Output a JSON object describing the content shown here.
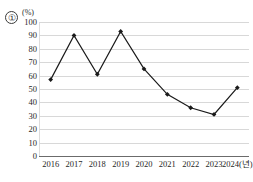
{
  "figure": {
    "item_number": "①",
    "unit_label": "(%)"
  },
  "chart_data": {
    "type": "line",
    "title": "",
    "xlabel": "",
    "ylabel": "(%)",
    "categories": [
      "2016",
      "2017",
      "2018",
      "2019",
      "2020",
      "2021",
      "2022",
      "2023",
      "2024"
    ],
    "x_tick_labels": [
      "2016",
      "2017",
      "2018",
      "2019",
      "2020",
      "2021",
      "2022",
      "2023",
      "2024(년)"
    ],
    "values": [
      57,
      90,
      61,
      93,
      65,
      46,
      36,
      31,
      51
    ],
    "ylim": [
      0,
      100
    ],
    "y_ticks": [
      100,
      90,
      80,
      70,
      60,
      50,
      40,
      30,
      20,
      10,
      0
    ],
    "y_tick_labels": [
      "100",
      "90",
      "80",
      "70",
      "60",
      "50",
      "40",
      "30",
      "20",
      "10",
      "0"
    ],
    "grid": true,
    "legend": false,
    "marker": "diamond",
    "line_color": "#1a1a1a",
    "marker_color": "#1a1a1a",
    "grid_color": "#d8d8d8",
    "axis_color": "#6b6b6b"
  }
}
